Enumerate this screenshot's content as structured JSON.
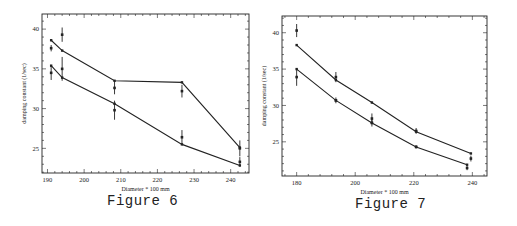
{
  "figures": [
    {
      "caption": "Figure 6",
      "xlabel": "Diameter * 100 mm",
      "ylabel": "damping constant (1/sec)"
    },
    {
      "caption": "Figure 7",
      "xlabel": "Diameter * 100 mm",
      "ylabel": "damping constant (1/sec)"
    }
  ],
  "chart_data": [
    {
      "type": "line",
      "title": "Figure 6",
      "xlabel": "Diameter * 100 mm",
      "ylabel": "damping constant (1/sec)",
      "xlim": [
        188.5,
        245
      ],
      "ylim": [
        21.9,
        41.9
      ],
      "xticks": [
        190,
        200,
        210,
        220,
        230,
        240
      ],
      "yticks": [
        25,
        30,
        35,
        40
      ],
      "grid": false,
      "legend": null,
      "series": [
        {
          "name": "upper fit",
          "style": "line-with-markers",
          "x": [
            191,
            194,
            208.3,
            226.7,
            242.5
          ],
          "y": [
            38.6,
            37.3,
            33.5,
            33.3,
            25.1
          ]
        },
        {
          "name": "lower fit",
          "style": "line-with-markers",
          "x": [
            191,
            194,
            208.3,
            226.7,
            242.5
          ],
          "y": [
            35.4,
            33.9,
            30.6,
            25.5,
            22.85
          ]
        },
        {
          "name": "measured (upper)",
          "style": "points-with-errorbars",
          "x": [
            191,
            194,
            208.3,
            226.7,
            242.5
          ],
          "y": [
            37.6,
            39.3,
            32.6,
            32.2,
            25.0
          ],
          "err": [
            0.4,
            0.9,
            0.8,
            0.8,
            1.0
          ]
        },
        {
          "name": "measured (lower)",
          "style": "points-with-errorbars",
          "x": [
            191,
            194,
            208.3,
            226.7,
            242.5
          ],
          "y": [
            34.5,
            35.0,
            29.8,
            26.4,
            23.3
          ],
          "err": [
            0.9,
            1.5,
            1.2,
            0.9,
            0.6
          ]
        }
      ]
    },
    {
      "type": "line",
      "title": "Figure 7",
      "xlabel": "Diameter * 100 mm",
      "ylabel": "damping constant (1/sec)",
      "xlim": [
        175,
        245
      ],
      "ylim": [
        20.3,
        42.3
      ],
      "xticks": [
        180,
        200,
        220,
        240
      ],
      "yticks": [
        25,
        30,
        35,
        40
      ],
      "grid": false,
      "legend": null,
      "series": [
        {
          "name": "upper fit",
          "style": "line-with-markers",
          "x": [
            180,
            193.4,
            205.7,
            220.8,
            239.5
          ],
          "y": [
            38.3,
            33.5,
            30.4,
            26.4,
            23.4
          ]
        },
        {
          "name": "lower fit",
          "style": "line-with-markers",
          "x": [
            180,
            193.4,
            205.7,
            220.8,
            238.2
          ],
          "y": [
            35.0,
            30.7,
            27.6,
            24.3,
            21.85
          ]
        },
        {
          "name": "measured (upper)",
          "style": "points-with-errorbars",
          "x": [
            180,
            193.4,
            205.7,
            220.8,
            239.5
          ],
          "y": [
            40.3,
            33.9,
            28.2,
            26.5,
            22.7
          ],
          "err": [
            0.9,
            0.7,
            0.7,
            0.4,
            0.4
          ]
        },
        {
          "name": "measured (lower)",
          "style": "points-with-errorbars",
          "x": [
            180,
            193.4,
            205.7,
            220.8,
            238.2
          ],
          "y": [
            33.9,
            30.7,
            27.6,
            24.3,
            21.4
          ],
          "err": [
            1.2,
            0.4,
            0.5,
            0.2,
            0.3
          ]
        }
      ]
    }
  ],
  "layout": [
    {
      "frame": {
        "left": 42,
        "top": 14,
        "right": 249,
        "bottom": 173
      },
      "caption_pos": {
        "left": 107,
        "top": 193
      }
    },
    {
      "frame": {
        "left": 282,
        "top": 16,
        "right": 487,
        "bottom": 176
      },
      "caption_pos": {
        "left": 355,
        "top": 196
      }
    }
  ],
  "colors": {
    "ink": "#222222",
    "background": "#ffffff"
  }
}
